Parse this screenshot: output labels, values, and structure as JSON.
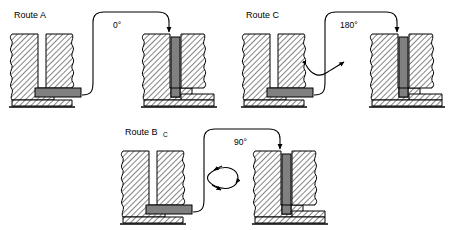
{
  "figure": {
    "title": "",
    "background_color": "#ffffff",
    "line_color": "#000000",
    "hatch_color": "#7a7a7a",
    "bar_color": "#808080",
    "bar_edge_color": "#000000"
  },
  "panels": [
    {
      "id": "route-a",
      "label": "Route A",
      "label_sub": "",
      "angle_label": "0°",
      "rotation_indicator": "none",
      "before_state": "bar-horizontal-in-slot",
      "after_state": "bar-vertical-inserted"
    },
    {
      "id": "route-c",
      "label": "Route C",
      "label_sub": "",
      "angle_label": "180°",
      "rotation_indicator": "arc-double-arrow",
      "before_state": "bar-horizontal-in-slot",
      "after_state": "bar-vertical-inserted"
    },
    {
      "id": "route-bc",
      "label": "Route B",
      "label_sub": "C",
      "angle_label": "90°",
      "rotation_indicator": "ellipse-double-arrow",
      "before_state": "bar-horizontal-in-slot",
      "after_state": "bar-vertical-inserted"
    }
  ]
}
